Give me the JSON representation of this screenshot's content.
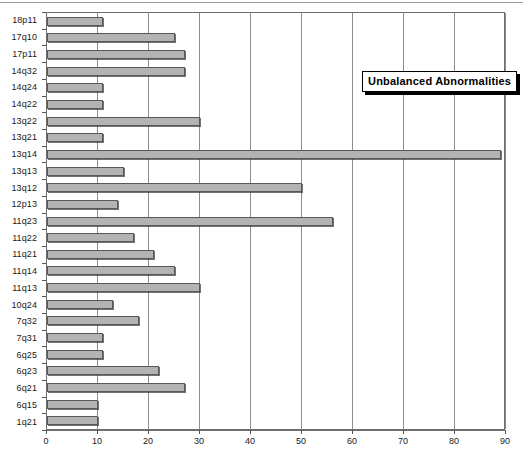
{
  "chart_data": {
    "type": "bar",
    "orientation": "horizontal",
    "title": "",
    "xlabel": "",
    "ylabel": "",
    "xlim": [
      0,
      90
    ],
    "xticks": [
      0,
      10,
      20,
      30,
      40,
      50,
      60,
      70,
      80,
      90
    ],
    "grid": true,
    "legend": {
      "position": "top-right-inside",
      "entries": [
        "Unbalanced Abnormalities"
      ]
    },
    "series": [
      {
        "name": "Unbalanced Abnormalities",
        "color": "#b3b3b3",
        "values": [
          11,
          25,
          27,
          27,
          11,
          11,
          30,
          11,
          89,
          15,
          50,
          14,
          56,
          17,
          21,
          25,
          30,
          13,
          18,
          11,
          11,
          22,
          27,
          10,
          10
        ]
      }
    ],
    "categories": [
      "18p11",
      "17q10",
      "17p11",
      "14q32",
      "14q24",
      "14q22",
      "13q22",
      "13q21",
      "13q14",
      "13q13",
      "13q12",
      "12p13",
      "11q23",
      "11q22",
      "11q21",
      "11q14",
      "11q13",
      "10q24",
      "7q32",
      "7q31",
      "6q25",
      "6q23",
      "6q21",
      "6q15",
      "1q21"
    ]
  },
  "legend": {
    "label": "Unbalanced Abnormalities"
  },
  "axis": {
    "x_tick_labels": [
      "0",
      "10",
      "20",
      "30",
      "40",
      "50",
      "60",
      "70",
      "80",
      "90"
    ]
  }
}
